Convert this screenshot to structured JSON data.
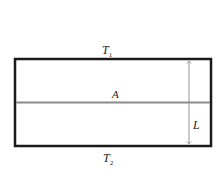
{
  "diagram": {
    "type": "heat-conduction-slab",
    "labels": {
      "top_temperature": "T",
      "top_temperature_sub": "1",
      "bottom_temperature": "T",
      "bottom_temperature_sub": "2",
      "area": "A",
      "thickness": "L"
    },
    "colors": {
      "border": "#1a1a1a",
      "midline": "#8a8a8a",
      "arrow": "#8a8a8a",
      "text": "#222222"
    }
  }
}
